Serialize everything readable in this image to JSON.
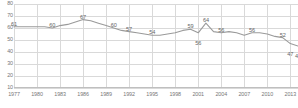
{
  "chart_data": {
    "type": "line",
    "title": "",
    "subtitle": "",
    "xlabel": "",
    "ylabel": "",
    "ylim": [
      10,
      80
    ],
    "xlim": [
      1977,
      2014
    ],
    "grid": true,
    "legend": false,
    "line_color": "#9a9a9a",
    "grid_color": "#d9d9d9",
    "text_color": "#777777",
    "background": "#ffffff",
    "y_ticks": [
      80,
      70,
      60,
      50,
      40,
      30,
      20,
      10
    ],
    "x_ticks": [
      1977,
      1980,
      1983,
      1986,
      1989,
      1992,
      1995,
      1998,
      2001,
      2004,
      2007,
      2010,
      2013
    ],
    "x": [
      1977,
      1978,
      1979,
      1980,
      1981,
      1982,
      1983,
      1984,
      1985,
      1986,
      1987,
      1988,
      1989,
      1990,
      1991,
      1992,
      1993,
      1994,
      1995,
      1996,
      1997,
      1998,
      1999,
      2000,
      2001,
      2002,
      2003,
      2004,
      2005,
      2006,
      2007,
      2008,
      2009,
      2010,
      2011,
      2012,
      2013,
      2014
    ],
    "values": [
      61,
      61,
      61,
      61,
      61,
      60,
      62,
      63,
      65,
      67,
      66,
      64,
      62,
      60,
      58,
      57,
      56,
      55,
      54,
      54,
      55,
      56,
      58,
      59,
      56,
      64,
      57,
      56,
      57,
      56,
      54,
      56,
      56,
      55,
      53,
      52,
      47,
      45
    ],
    "point_labels": [
      {
        "x": 1977,
        "value": 61,
        "text": "61",
        "dx": 0,
        "dy": -5
      },
      {
        "x": 1982,
        "value": 60,
        "text": "60",
        "dx": 0,
        "dy": -5
      },
      {
        "x": 1986,
        "value": 67,
        "text": "67",
        "dx": 0,
        "dy": -5
      },
      {
        "x": 1990,
        "value": 60,
        "text": "60",
        "dx": 0,
        "dy": -5
      },
      {
        "x": 1992,
        "value": 57,
        "text": "57",
        "dx": 0,
        "dy": -5
      },
      {
        "x": 1995,
        "value": 54,
        "text": "54",
        "dx": 0,
        "dy": -5
      },
      {
        "x": 2000,
        "value": 59,
        "text": "59",
        "dx": 0,
        "dy": -5
      },
      {
        "x": 2001,
        "value": 56,
        "text": "56",
        "dx": 0,
        "dy": 8
      },
      {
        "x": 2002,
        "value": 64,
        "text": "64",
        "dx": 0,
        "dy": -5
      },
      {
        "x": 2004,
        "value": 56,
        "text": "56",
        "dx": 0,
        "dy": -5
      },
      {
        "x": 2008,
        "value": 56,
        "text": "56",
        "dx": 0,
        "dy": -5
      },
      {
        "x": 2012,
        "value": 52,
        "text": "52",
        "dx": 0,
        "dy": -5
      },
      {
        "x": 2013,
        "value": 47,
        "text": "47",
        "dx": 0,
        "dy": 8
      },
      {
        "x": 2014,
        "value": 45,
        "text": "45",
        "dx": 0,
        "dy": 8
      }
    ]
  }
}
